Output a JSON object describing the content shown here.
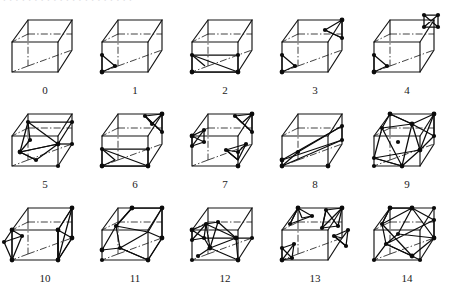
{
  "figure": {
    "top_cut_text": ". . . .   . . .   . . . . . . . . .   . . . . .",
    "rows": 3,
    "columns": 5,
    "total_cases": 15,
    "colors": {
      "background": "#ffffff",
      "cube_edge": "#141414",
      "isosurface_line": "#0b0b0b",
      "node_marker": "#0b0b0b",
      "label_text": "#1a1a1a"
    }
  },
  "cells": [
    {
      "label": "0",
      "name": "case-0",
      "node_count": 0,
      "description": "empty cube, no isosurface"
    },
    {
      "label": "1",
      "name": "case-1",
      "node_count": 3,
      "description": "single corner triangle, front-left-bottom"
    },
    {
      "label": "2",
      "name": "case-2",
      "node_count": 4,
      "description": "quad across bottom-front edge pair"
    },
    {
      "label": "3",
      "name": "case-3",
      "node_count": 6,
      "description": "two separate corner triangles, opposite corners"
    },
    {
      "label": "4",
      "name": "case-4",
      "node_count": 6,
      "description": "corner triangle plus diagonal corner star"
    },
    {
      "label": "5",
      "name": "case-5",
      "node_count": 8,
      "description": "connected multi-triangle fan through interior"
    },
    {
      "label": "6",
      "name": "case-6",
      "node_count": 8,
      "description": "bottom quad plus isolated top corner star"
    },
    {
      "label": "7",
      "name": "case-7",
      "node_count": 10,
      "description": "three isolated corner clusters"
    },
    {
      "label": "8",
      "name": "case-8",
      "node_count": 6,
      "description": "diagonal planar slab through cube"
    },
    {
      "label": "9",
      "name": "case-9",
      "node_count": 10,
      "description": "large hexagonal band around cube"
    },
    {
      "label": "10",
      "name": "case-10",
      "node_count": 8,
      "description": "two opposing vertical edge triangle pairs"
    },
    {
      "label": "11",
      "name": "case-11",
      "node_count": 8,
      "description": "folded band through interior"
    },
    {
      "label": "12",
      "name": "case-12",
      "node_count": 11,
      "description": "dense multi-facet mesh, left heavy"
    },
    {
      "label": "13",
      "name": "case-13",
      "node_count": 12,
      "description": "four isolated corner clusters, diagonal pairs"
    },
    {
      "label": "14",
      "name": "case-14",
      "node_count": 11,
      "description": "large wrapping band with corner facets"
    }
  ]
}
